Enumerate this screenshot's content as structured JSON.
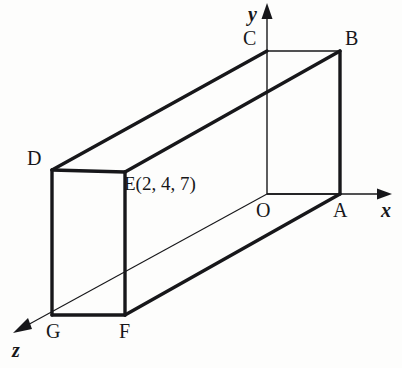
{
  "figure": {
    "background_color": "#fdfdfc",
    "stroke_color": "#17171a",
    "thick_width": 3.2,
    "thin_width": 1.3,
    "hairline_width": 1.0
  },
  "axes": [
    {
      "name": "x",
      "label": "x",
      "label_x": 381,
      "label_y": 200,
      "from": [
        267,
        194
      ],
      "to": [
        392,
        194
      ],
      "arrow": "right"
    },
    {
      "name": "y",
      "label": "y",
      "label_x": 248,
      "label_y": 4,
      "from": [
        267,
        194
      ],
      "to": [
        267,
        6
      ],
      "arrow": "up"
    },
    {
      "name": "z",
      "label": "z",
      "label_x": 12,
      "label_y": 340,
      "from": [
        267,
        194
      ],
      "to": [
        14,
        330
      ],
      "arrow": "down-left"
    }
  ],
  "vertices": [
    {
      "id": "A",
      "label": "A",
      "x": 340,
      "y": 194,
      "label_x": 333,
      "label_y": 200
    },
    {
      "id": "B",
      "label": "B",
      "x": 340,
      "y": 51,
      "label_x": 345,
      "label_y": 28
    },
    {
      "id": "C",
      "label": "C",
      "x": 267,
      "y": 51,
      "label_x": 243,
      "label_y": 28
    },
    {
      "id": "D",
      "label": "D",
      "x": 52,
      "y": 170,
      "label_x": 27,
      "label_y": 148
    },
    {
      "id": "E",
      "label": "E(2, 4, 7)",
      "x": 125,
      "y": 172,
      "label_x": 124,
      "label_y": 174
    },
    {
      "id": "F",
      "label": "F",
      "x": 125,
      "y": 315,
      "label_x": 119,
      "label_y": 321
    },
    {
      "id": "G",
      "label": "G",
      "x": 52,
      "y": 315,
      "label_x": 46,
      "label_y": 321
    },
    {
      "id": "O",
      "label": "O",
      "x": 267,
      "y": 194,
      "label_x": 256,
      "label_y": 200
    }
  ],
  "edges": [
    {
      "name": "edge-C-B",
      "from": "C",
      "to": "B",
      "weight": "thin"
    },
    {
      "name": "edge-B-A",
      "from": "B",
      "to": "A",
      "weight": "thick"
    },
    {
      "name": "edge-O-A",
      "from": "O",
      "to": "A",
      "weight": "thin"
    },
    {
      "name": "edge-O-C",
      "from": "O",
      "to": "C",
      "weight": "thin"
    },
    {
      "name": "edge-D-C",
      "from": "D",
      "to": "C",
      "weight": "thick"
    },
    {
      "name": "edge-E-B",
      "from": "E",
      "to": "B",
      "weight": "thick"
    },
    {
      "name": "edge-D-E",
      "from": "D",
      "to": "E",
      "weight": "thick"
    },
    {
      "name": "edge-D-G",
      "from": "D",
      "to": "G",
      "weight": "thick"
    },
    {
      "name": "edge-G-F",
      "from": "G",
      "to": "F",
      "weight": "thick"
    },
    {
      "name": "edge-E-F",
      "from": "E",
      "to": "F",
      "weight": "thick"
    },
    {
      "name": "edge-F-A",
      "from": "F",
      "to": "A",
      "weight": "thick"
    },
    {
      "name": "edge-G-O-axis",
      "from": "G",
      "to": "O",
      "weight": "hairline"
    }
  ],
  "point_coordinates": {
    "E": {
      "x": 2,
      "y": 4,
      "z": 7,
      "text": "E(2, 4, 7)"
    }
  }
}
